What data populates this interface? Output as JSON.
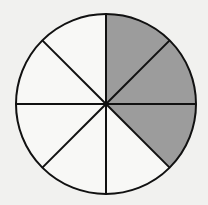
{
  "diagram": {
    "type": "fraction-circle",
    "total_sectors": 8,
    "shaded_sectors": 3,
    "shaded_indices": [
      0,
      1,
      2
    ],
    "start_angle_deg": -90,
    "center": [
      106,
      104
    ],
    "radius": 90,
    "colors": {
      "background": "#f1f1ef",
      "sector_unshaded": "#f8f8f6",
      "sector_shaded": "#9c9c9c",
      "stroke": "#111111"
    },
    "stroke_width": 2
  }
}
